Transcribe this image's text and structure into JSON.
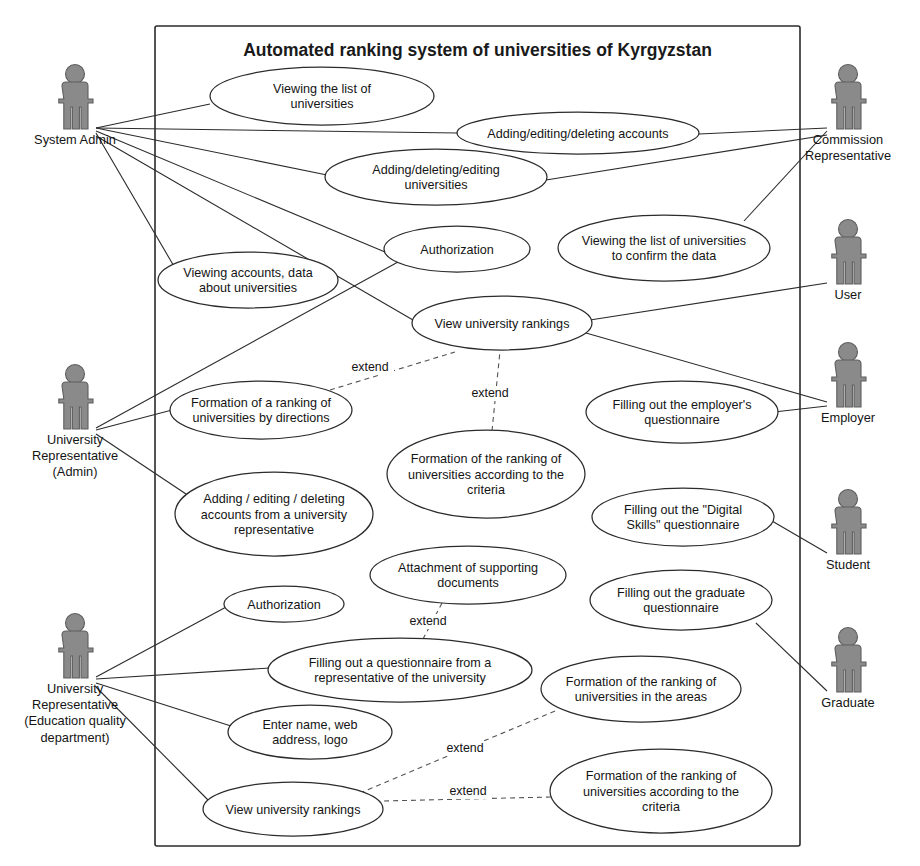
{
  "diagram": {
    "title": "Automated ranking system of universities of Kyrgyzstan",
    "type": "uml-use-case-diagram",
    "colors": {
      "actor_fill": "#8a8a8a",
      "actor_stroke": "#5e5e5e",
      "line": "#2b2b2b",
      "extend_line": "#545454",
      "background": "#ffffff"
    },
    "system_boundary": {
      "x": 155,
      "y": 26,
      "width": 645,
      "height": 820
    },
    "actors": [
      {
        "id": "system-admin",
        "label": "System Admin",
        "label_lines": [
          "System Admin"
        ],
        "side": "left",
        "x": 75,
        "y": 103,
        "connector": {
          "x": 96,
          "y": 128
        }
      },
      {
        "id": "university-representative-admin",
        "label": "University Representative (Admin)",
        "label_lines": [
          "University",
          "Representative",
          "(Admin)"
        ],
        "side": "left",
        "x": 75,
        "y": 403,
        "connector": {
          "x": 96,
          "y": 428
        }
      },
      {
        "id": "university-representative-education-quality",
        "label": "University Representative (Education quality department)",
        "label_lines": [
          "University",
          "Representative",
          "(Education quality",
          "department)"
        ],
        "side": "left",
        "x": 75,
        "y": 652,
        "connector": {
          "x": 96,
          "y": 677
        }
      },
      {
        "id": "commission-representative",
        "label": "Commission Representative",
        "label_lines": [
          "Commission",
          "Representative"
        ],
        "side": "right",
        "x": 848,
        "y": 103,
        "connector": {
          "x": 827,
          "y": 128
        }
      },
      {
        "id": "user",
        "label": "User",
        "label_lines": [
          "User"
        ],
        "side": "right",
        "x": 848,
        "y": 258,
        "connector": {
          "x": 827,
          "y": 283
        }
      },
      {
        "id": "employer",
        "label": "Employer",
        "label_lines": [
          "Employer"
        ],
        "side": "right",
        "x": 848,
        "y": 381,
        "connector": {
          "x": 827,
          "y": 406
        }
      },
      {
        "id": "student",
        "label": "Student",
        "label_lines": [
          "Student"
        ],
        "side": "right",
        "x": 848,
        "y": 528,
        "connector": {
          "x": 827,
          "y": 553
        }
      },
      {
        "id": "graduate",
        "label": "Graduate",
        "label_lines": [
          "Graduate"
        ],
        "side": "right",
        "x": 848,
        "y": 666,
        "connector": {
          "x": 827,
          "y": 691
        }
      }
    ],
    "use_cases": [
      {
        "id": "viewing-list-of-universities",
        "label": "Viewing the list of universities",
        "label_lines": [
          "Viewing the list of",
          "universities"
        ],
        "cx": 322,
        "cy": 96,
        "rx": 112,
        "ry": 29
      },
      {
        "id": "adding-editing-deleting-accounts",
        "label": "Adding/editing/deleting accounts",
        "label_lines": [
          "Adding/editing/deleting accounts"
        ],
        "cx": 578,
        "cy": 133,
        "rx": 121,
        "ry": 21
      },
      {
        "id": "adding-deleting-editing-universities",
        "label": "Adding/deleting/editing universities",
        "label_lines": [
          "Adding/deleting/editing",
          "universities"
        ],
        "cx": 436,
        "cy": 177,
        "rx": 111,
        "ry": 28
      },
      {
        "id": "authorization-top",
        "label": "Authorization",
        "label_lines": [
          "Authorization"
        ],
        "cx": 457,
        "cy": 249,
        "rx": 73,
        "ry": 23
      },
      {
        "id": "viewing-list-to-confirm-data",
        "label": "Viewing the list of universities to confirm the data",
        "label_lines": [
          "Viewing the list of universities",
          "to confirm the data"
        ],
        "cx": 664,
        "cy": 248,
        "rx": 106,
        "ry": 33
      },
      {
        "id": "viewing-accounts-data-about-universities",
        "label": "Viewing accounts, data about universities",
        "label_lines": [
          "Viewing accounts, data",
          "about universities"
        ],
        "cx": 248,
        "cy": 280,
        "rx": 90,
        "ry": 28
      },
      {
        "id": "view-university-rankings-top",
        "label": "View university rankings",
        "label_lines": [
          "View university rankings"
        ],
        "cx": 502,
        "cy": 323,
        "rx": 90,
        "ry": 27
      },
      {
        "id": "formation-ranking-by-directions",
        "label": "Formation of a ranking of universities by directions",
        "label_lines": [
          "Formation of a ranking of",
          "universities by directions"
        ],
        "cx": 261,
        "cy": 410,
        "rx": 91,
        "ry": 29
      },
      {
        "id": "formation-ranking-criteria-mid",
        "label": "Formation of the ranking of universities according to the criteria",
        "label_lines": [
          "Formation of the ranking of",
          "universities according to the",
          "criteria"
        ],
        "cx": 486,
        "cy": 474,
        "rx": 99,
        "ry": 44
      },
      {
        "id": "filling-employer-questionnaire",
        "label": "Filling out the employer's questionnaire",
        "label_lines": [
          "Filling out the employer's",
          "questionnaire"
        ],
        "cx": 682,
        "cy": 412,
        "rx": 96,
        "ry": 31
      },
      {
        "id": "adding-editing-deleting-accounts-from-university-rep",
        "label": "Adding / editing / deleting accounts from a university representative",
        "label_lines": [
          "Adding / editing / deleting",
          "accounts from a university",
          "representative"
        ],
        "cx": 274,
        "cy": 514,
        "rx": 99,
        "ry": 42
      },
      {
        "id": "filling-digital-skills-questionnaire",
        "label": "Filling out the \"Digital Skills\" questionnaire",
        "label_lines": [
          "Filling out the \"Digital",
          "Skills\" questionnaire"
        ],
        "cx": 683,
        "cy": 517,
        "rx": 91,
        "ry": 29
      },
      {
        "id": "attachment-of-supporting-documents",
        "label": "Attachment of supporting documents",
        "label_lines": [
          "Attachment of supporting",
          "documents"
        ],
        "cx": 468,
        "cy": 575,
        "rx": 98,
        "ry": 29
      },
      {
        "id": "filling-graduate-questionnaire",
        "label": "Filling out the graduate questionnaire",
        "label_lines": [
          "Filling out the graduate",
          "questionnaire"
        ],
        "cx": 681,
        "cy": 600,
        "rx": 91,
        "ry": 30
      },
      {
        "id": "authorization-bottom",
        "label": "Authorization",
        "label_lines": [
          "Authorization"
        ],
        "cx": 284,
        "cy": 604,
        "rx": 60,
        "ry": 18
      },
      {
        "id": "filling-questionnaire-from-university-rep",
        "label": "Filling out a questionnaire from a representative of the university",
        "label_lines": [
          "Filling out a questionnaire from a",
          "representative of the university"
        ],
        "cx": 400,
        "cy": 670,
        "rx": 132,
        "ry": 32
      },
      {
        "id": "formation-ranking-in-the-areas",
        "label": "Formation of the ranking of universities in the areas",
        "label_lines": [
          "Formation of the ranking of",
          "universities in the areas"
        ],
        "cx": 641,
        "cy": 689,
        "rx": 100,
        "ry": 33
      },
      {
        "id": "enter-name-web-address-logo",
        "label": "Enter name, web address, logo",
        "label_lines": [
          "Enter name, web",
          "address, logo"
        ],
        "cx": 310,
        "cy": 732,
        "rx": 82,
        "ry": 27
      },
      {
        "id": "formation-ranking-criteria-bottom",
        "label": "Formation of the ranking of universities according to the criteria",
        "label_lines": [
          "Formation of the ranking of",
          "universities according to the",
          "criteria"
        ],
        "cx": 661,
        "cy": 791,
        "rx": 111,
        "ry": 42
      },
      {
        "id": "view-university-rankings-bottom",
        "label": "View university rankings",
        "label_lines": [
          "View university rankings"
        ],
        "cx": 293,
        "cy": 809,
        "rx": 90,
        "ry": 27
      }
    ],
    "associations": [
      {
        "from": "system-admin",
        "to": "viewing-list-of-universities",
        "points": "96,128 210,104"
      },
      {
        "from": "system-admin",
        "to": "adding-editing-deleting-accounts",
        "points": "96,128 458,133"
      },
      {
        "from": "system-admin",
        "to": "adding-deleting-editing-universities",
        "points": "96,128 327,175"
      },
      {
        "from": "system-admin",
        "to": "authorization-top",
        "points": "96,131 385,252"
      },
      {
        "from": "system-admin",
        "to": "viewing-accounts-data-about-universities",
        "points": "96,133 175,268"
      },
      {
        "from": "system-admin",
        "to": "view-university-rankings-top",
        "points": "96,136 413,320"
      },
      {
        "from": "commission-representative",
        "to": "adding-editing-deleting-accounts",
        "points": "827,128 699,134"
      },
      {
        "from": "commission-representative",
        "to": "viewing-list-to-confirm-data",
        "points": "827,131 744,221"
      },
      {
        "from": "commission-representative",
        "to": "adding-deleting-editing-universities",
        "points": "827,135 546,180"
      },
      {
        "from": "user",
        "to": "view-university-rankings-top",
        "points": "827,283 590,320"
      },
      {
        "from": "university-representative-admin",
        "to": "authorization-top",
        "points": "96,428 398,262"
      },
      {
        "from": "university-representative-admin",
        "to": "formation-ranking-by-directions",
        "points": "96,430 172,410"
      },
      {
        "from": "university-representative-admin",
        "to": "adding-editing-deleting-accounts-from-university-rep",
        "points": "96,434 186,494"
      },
      {
        "from": "employer",
        "to": "filling-employer-questionnaire",
        "points": "827,406 774,412"
      },
      {
        "from": "employer",
        "to": "view-university-rankings-top",
        "points": "827,402 586,333"
      },
      {
        "from": "student",
        "to": "filling-digital-skills-questionnaire",
        "points": "827,553 772,521"
      },
      {
        "from": "graduate",
        "to": "filling-graduate-questionnaire",
        "points": "827,691 756,623"
      },
      {
        "from": "university-representative-education-quality",
        "to": "authorization-bottom",
        "points": "96,677 228,606"
      },
      {
        "from": "university-representative-education-quality",
        "to": "filling-questionnaire-from-university-rep",
        "points": "96,679 270,668"
      },
      {
        "from": "university-representative-education-quality",
        "to": "enter-name-web-address-logo",
        "points": "96,683 231,726"
      },
      {
        "from": "university-representative-education-quality",
        "to": "view-university-rankings-bottom",
        "points": "96,687 208,800"
      }
    ],
    "extend_relations": [
      {
        "label": "extend",
        "from": "formation-ranking-by-directions",
        "to": "view-university-rankings-top",
        "points": "330,390 455,352",
        "label_x": 370,
        "label_y": 371
      },
      {
        "label": "extend",
        "from": "formation-ranking-criteria-mid",
        "to": "view-university-rankings-top",
        "points": "492,431 500,351",
        "label_x": 490,
        "label_y": 397
      },
      {
        "label": "extend",
        "from": "attachment-of-supporting-documents",
        "to": "filling-questionnaire-from-university-rep",
        "points": "442,603 422,641",
        "label_x": 428,
        "label_y": 625
      },
      {
        "label": "extend",
        "from": "formation-ranking-in-the-areas",
        "to": "view-university-rankings-bottom",
        "points": "555,711 360,793",
        "label_x": 465,
        "label_y": 752
      },
      {
        "label": "extend",
        "from": "formation-ranking-criteria-bottom",
        "to": "view-university-rankings-bottom",
        "points": "551,797 383,801",
        "label_x": 468,
        "label_y": 795
      }
    ]
  }
}
